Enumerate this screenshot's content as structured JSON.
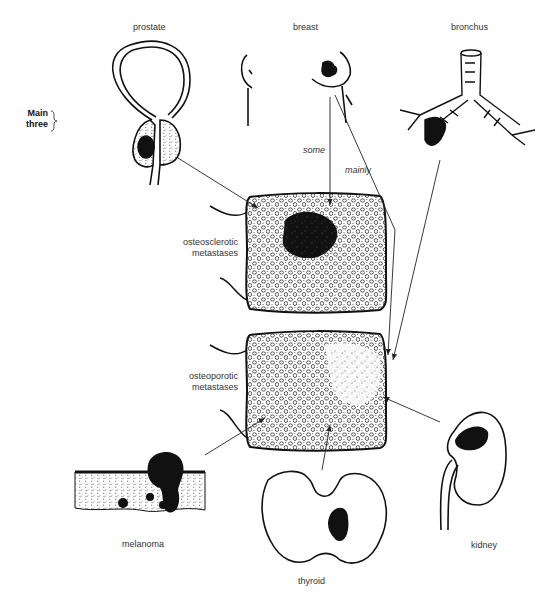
{
  "diagram": {
    "group_label": {
      "line1": "Main",
      "line2": "three"
    },
    "sources": [
      {
        "id": "prostate",
        "label": "prostate"
      },
      {
        "id": "breast",
        "label": "breast"
      },
      {
        "id": "bronchus",
        "label": "bronchus"
      },
      {
        "id": "melanoma",
        "label": "melanoma"
      },
      {
        "id": "thyroid",
        "label": "thyroid"
      },
      {
        "id": "kidney",
        "label": "kidney"
      }
    ],
    "targets": [
      {
        "id": "osteosclerotic",
        "line1": "osteosclerotic",
        "line2": "metastases"
      },
      {
        "id": "osteoporotic",
        "line1": "osteoporotic",
        "line2": "metastases"
      }
    ],
    "arrow_labels": {
      "some": "some",
      "mainly": "mainly"
    },
    "edges": [
      {
        "from": "prostate",
        "to": "osteosclerotic"
      },
      {
        "from": "breast",
        "to": "osteosclerotic",
        "label": "some"
      },
      {
        "from": "breast",
        "to": "osteoporotic",
        "label": "mainly"
      },
      {
        "from": "bronchus",
        "to": "osteoporotic"
      },
      {
        "from": "kidney",
        "to": "osteoporotic"
      },
      {
        "from": "thyroid",
        "to": "osteoporotic"
      },
      {
        "from": "melanoma",
        "to": "osteoporotic"
      }
    ]
  }
}
